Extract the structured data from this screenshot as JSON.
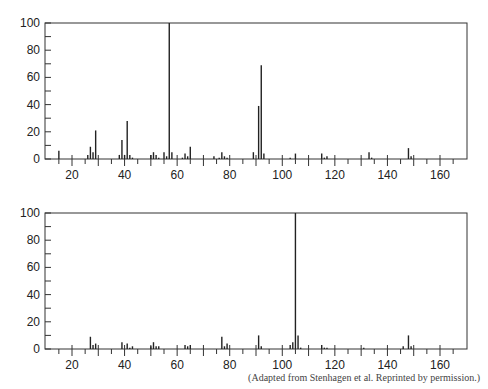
{
  "chart_data": [
    {
      "type": "bar",
      "title": "",
      "xlabel": "",
      "ylabel": "",
      "xlim": [
        11,
        170
      ],
      "ylim": [
        0,
        100
      ],
      "grid": false,
      "xticks_major": [
        20,
        40,
        60,
        80,
        100,
        120,
        140,
        160
      ],
      "yticks_major": [
        0,
        20,
        40,
        60,
        80,
        100
      ],
      "x": [
        15,
        26,
        27,
        28,
        29,
        38,
        39,
        40,
        41,
        42,
        43,
        50,
        51,
        52,
        53,
        55,
        56,
        57,
        58,
        62,
        63,
        64,
        65,
        74,
        76,
        77,
        78,
        79,
        89,
        91,
        92,
        93,
        103,
        105,
        115,
        116,
        117,
        133,
        134,
        148,
        149
      ],
      "values": [
        6,
        3,
        9,
        5,
        21,
        3,
        14,
        3,
        28,
        3,
        1,
        3,
        5,
        3,
        1,
        5,
        2,
        100,
        5,
        1,
        4,
        2,
        9,
        2,
        1,
        5,
        2,
        1,
        5,
        39,
        69,
        4,
        1,
        4,
        4,
        1,
        2,
        5,
        1,
        8,
        2
      ]
    },
    {
      "type": "bar",
      "title": "",
      "xlabel": "",
      "ylabel": "",
      "xlim": [
        11,
        170
      ],
      "ylim": [
        0,
        100
      ],
      "grid": false,
      "xticks_major": [
        20,
        40,
        60,
        80,
        100,
        120,
        140,
        160
      ],
      "yticks_major": [
        0,
        20,
        40,
        60,
        80,
        100
      ],
      "x": [
        27,
        28,
        29,
        39,
        41,
        42,
        43,
        50,
        51,
        52,
        53,
        63,
        64,
        65,
        77,
        78,
        79,
        91,
        92,
        103,
        104,
        105,
        106,
        107,
        115,
        116,
        117,
        131,
        146,
        148,
        149
      ],
      "values": [
        9,
        3,
        4,
        5,
        4,
        1,
        2,
        2,
        5,
        2,
        2,
        3,
        2,
        3,
        9,
        2,
        4,
        10,
        2,
        3,
        5,
        100,
        10,
        1,
        3,
        1,
        1,
        1,
        2,
        10,
        2
      ]
    }
  ],
  "credit": "(Adapted from Stenhagen et al. Reprinted by permission.)"
}
